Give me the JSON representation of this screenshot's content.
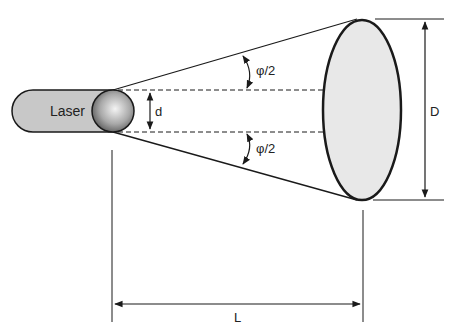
{
  "diagram": {
    "laser_label": "Laser",
    "aperture_label": "d",
    "half_angle_top_label": "φ/2",
    "half_angle_bottom_label": "φ/2",
    "spot_diameter_label": "D",
    "distance_label": "L"
  },
  "colors": {
    "laser_body": "#c8c8c8",
    "spot_fill": "#e8e8e8",
    "line": "#1a1a1a"
  }
}
